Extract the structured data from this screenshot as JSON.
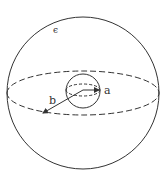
{
  "diagram": {
    "labels": {
      "epsilon": "ϵ",
      "inner_radius": "a",
      "outer_radius": "b"
    },
    "colors": {
      "stroke": "#333333",
      "background": "#ffffff"
    }
  }
}
